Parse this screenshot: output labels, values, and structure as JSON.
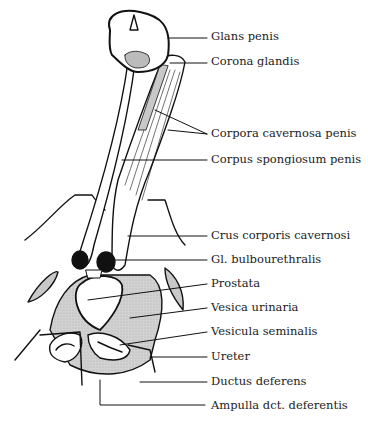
{
  "figure": {
    "colors": {
      "line": "#111111",
      "shade": "#c8c8c8",
      "dark": "#111111",
      "background": "#ffffff"
    }
  },
  "labels": [
    {
      "id": "glans",
      "text": "Glans penis",
      "x": 211,
      "y": 35
    },
    {
      "id": "corona",
      "text": "Corona glandis",
      "x": 211,
      "y": 59
    },
    {
      "id": "cavernosa",
      "text": "Corpora cavernosa penis",
      "x": 211,
      "y": 131
    },
    {
      "id": "spongiosum",
      "text": "Corpus spongiosum penis",
      "x": 211,
      "y": 157
    },
    {
      "id": "crus",
      "text": "Crus corporis cavernosi",
      "x": 211,
      "y": 232
    },
    {
      "id": "bulbo",
      "text": "Gl. bulbourethralis",
      "x": 211,
      "y": 256
    },
    {
      "id": "prostata",
      "text": "Prostata",
      "x": 211,
      "y": 281
    },
    {
      "id": "vesica",
      "text": "Vesica urinaria",
      "x": 211,
      "y": 305
    },
    {
      "id": "vesicula",
      "text": "Vesicula seminalis",
      "x": 211,
      "y": 329
    },
    {
      "id": "ureter",
      "text": "Ureter",
      "x": 211,
      "y": 353
    },
    {
      "id": "ductus",
      "text": "Ductus deferens",
      "x": 211,
      "y": 378
    },
    {
      "id": "ampulla",
      "text": "Ampulla dct. deferentis",
      "x": 211,
      "y": 403
    }
  ]
}
